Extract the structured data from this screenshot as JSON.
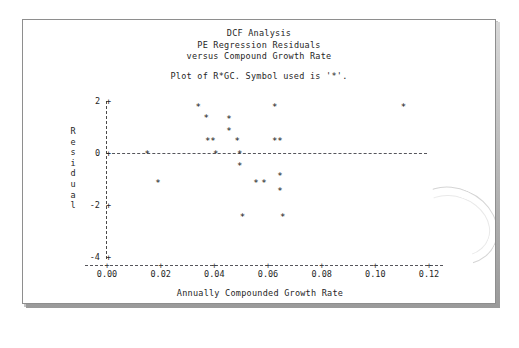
{
  "document": {
    "kind": "printed-statistical-output-page",
    "background_color": "#ffffff",
    "page_color": "#ffffff",
    "border_color": "#8e8e8e"
  },
  "header": {
    "title_lines": [
      "DCF Analysis",
      "PE Regression Residuals",
      "versus Compound Growth Rate"
    ],
    "plot_legend_line": "Plot of R*GC.  Symbol used is '*'."
  },
  "chart_data": {
    "type": "scatter",
    "title": "DCF Analysis PE Regression Residuals versus Compound Growth Rate",
    "xlabel": "Annually Compounded Growth Rate",
    "ylabel": "Residual",
    "ylabel_chars": [
      "R",
      "e",
      "s",
      "i",
      "d",
      "u",
      "a",
      "l"
    ],
    "symbol": "*",
    "marker_glyph": "*",
    "grid": false,
    "legend": null,
    "xlim": [
      -0.004,
      0.128
    ],
    "ylim": [
      -4.6,
      2.6
    ],
    "xticks": [
      0.0,
      0.02,
      0.04,
      0.06,
      0.08,
      0.1,
      0.12
    ],
    "xticklabels": [
      "0.00",
      "0.02",
      "0.04",
      "0.06",
      "0.08",
      "0.10",
      "0.12"
    ],
    "yticks": [
      2,
      0,
      -2,
      -4
    ],
    "yticklabels": [
      "2",
      "0",
      "-2",
      "-4"
    ],
    "reference_lines": [
      {
        "orientation": "horizontal",
        "value": 0,
        "style": "dashed"
      }
    ],
    "points": [
      {
        "x": 0.015,
        "y": 0.05
      },
      {
        "x": 0.019,
        "y": -1.05
      },
      {
        "x": 0.034,
        "y": 1.85
      },
      {
        "x": 0.037,
        "y": 1.45
      },
      {
        "x": 0.0375,
        "y": 0.55
      },
      {
        "x": 0.0395,
        "y": 0.55
      },
      {
        "x": 0.0405,
        "y": 0.05
      },
      {
        "x": 0.0455,
        "y": 1.4
      },
      {
        "x": 0.0455,
        "y": 0.95
      },
      {
        "x": 0.0485,
        "y": 0.55
      },
      {
        "x": 0.0495,
        "y": 0.05
      },
      {
        "x": 0.0495,
        "y": -0.4
      },
      {
        "x": 0.0505,
        "y": -2.35
      },
      {
        "x": 0.0555,
        "y": -1.05
      },
      {
        "x": 0.0585,
        "y": -1.05
      },
      {
        "x": 0.0625,
        "y": 1.85
      },
      {
        "x": 0.0625,
        "y": 0.55
      },
      {
        "x": 0.0645,
        "y": 0.55
      },
      {
        "x": 0.0645,
        "y": -0.8
      },
      {
        "x": 0.0645,
        "y": -1.35
      },
      {
        "x": 0.0655,
        "y": -2.35
      },
      {
        "x": 0.1105,
        "y": 1.85
      }
    ]
  }
}
